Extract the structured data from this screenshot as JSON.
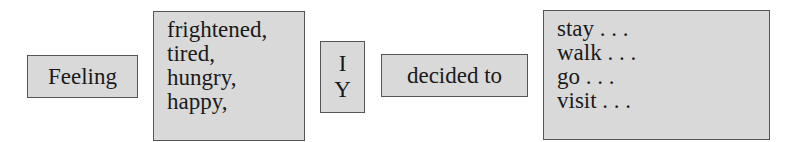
{
  "diagram": {
    "boxes": [
      {
        "id": "feeling",
        "label": "Feeling"
      },
      {
        "id": "feelings-list",
        "items": [
          "frightened,",
          "tired,",
          "hungry,",
          "happy,"
        ]
      },
      {
        "id": "subject",
        "items": [
          "I",
          "Y"
        ]
      },
      {
        "id": "verb",
        "label": "decided to"
      },
      {
        "id": "actions-list",
        "items": [
          "stay . . .",
          "walk . . .",
          "go . . .",
          "visit . . ."
        ]
      }
    ]
  }
}
